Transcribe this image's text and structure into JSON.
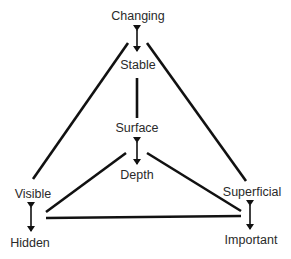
{
  "diagram": {
    "type": "triangle-of-opposites",
    "nodes": {
      "changing": "Changing",
      "stable": "Stable",
      "surface": "Surface",
      "depth": "Depth",
      "visible": "Visible",
      "hidden": "Hidden",
      "superficial": "Superficial",
      "important": "Important"
    },
    "pairs": [
      {
        "a": "Changing",
        "b": "Stable"
      },
      {
        "a": "Surface",
        "b": "Depth"
      },
      {
        "a": "Visible",
        "b": "Hidden"
      },
      {
        "a": "Superficial",
        "b": "Important"
      }
    ],
    "colors": {
      "line": "#111111",
      "text": "#2a2a2a",
      "background": "#ffffff"
    }
  }
}
